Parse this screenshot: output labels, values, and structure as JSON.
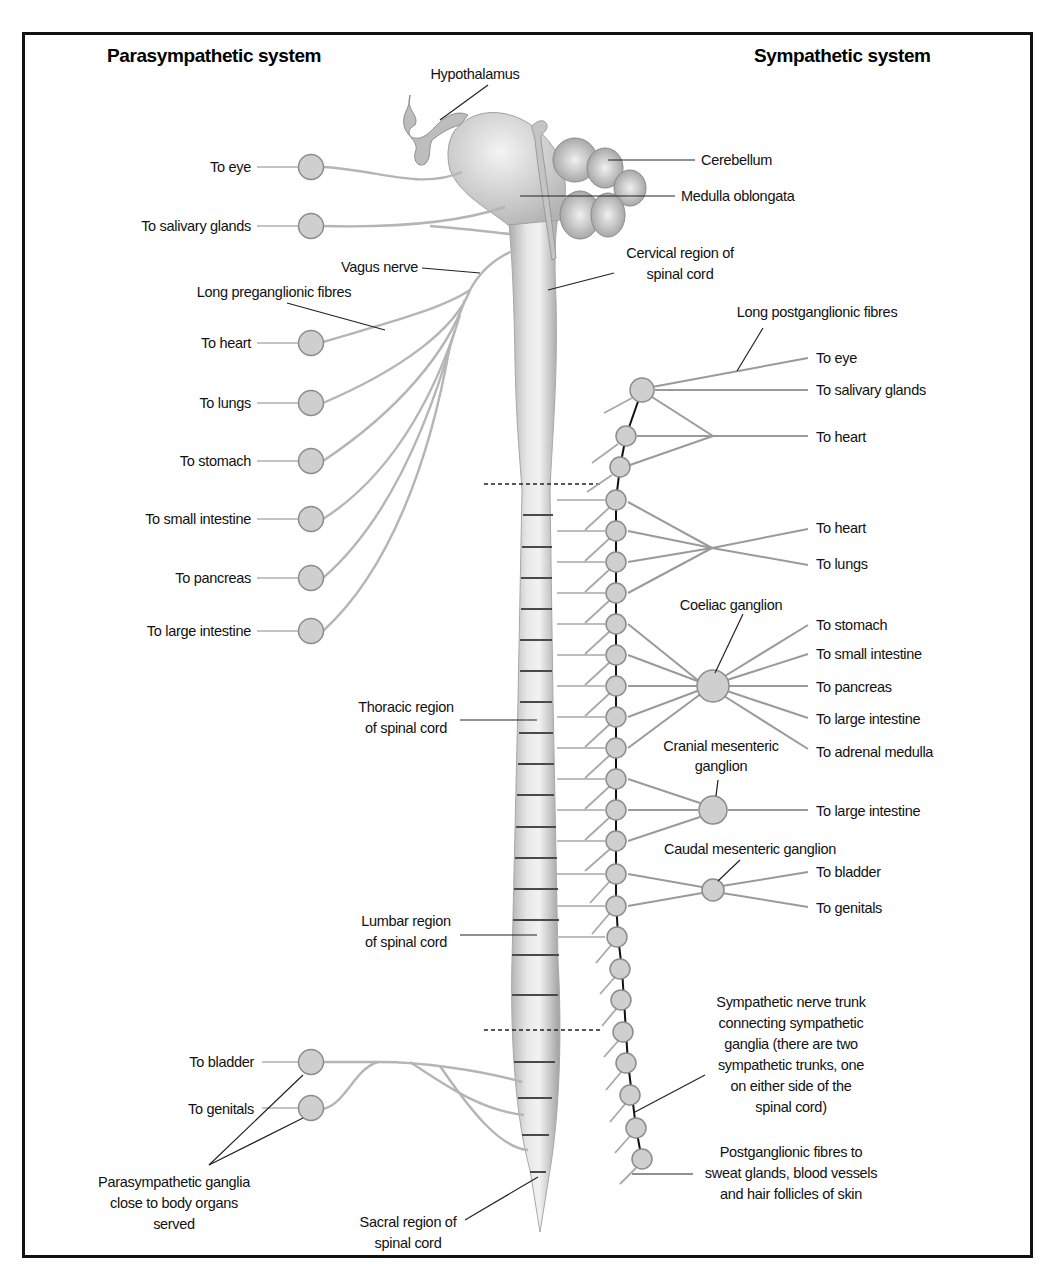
{
  "titles": {
    "parasympathetic": "Parasympathetic system",
    "sympathetic": "Sympathetic system"
  },
  "brain": {
    "hypothalamus": "Hypothalamus",
    "cerebellum": "Cerebellum",
    "medulla": "Medulla oblongata",
    "cervical_1": "Cervical region of",
    "cervical_2": "spinal cord",
    "thoracic_1": "Thoracic region",
    "thoracic_2": "of spinal cord",
    "lumbar_1": "Lumbar region",
    "lumbar_2": "of spinal cord",
    "sacral_1": "Sacral region of",
    "sacral_2": "spinal cord"
  },
  "parasympathetic": {
    "vagus": "Vagus nerve",
    "long_pre": "Long preganglionic fibres",
    "targets": [
      "To eye",
      "To salivary glands",
      "To heart",
      "To lungs",
      "To stomach",
      "To small intestine",
      "To pancreas",
      "To large intestine",
      "To bladder",
      "To genitals"
    ],
    "ganglia_note": [
      "Parasympathetic ganglia",
      "close to body organs",
      "served"
    ]
  },
  "sympathetic": {
    "long_post": "Long postganglionic fibres",
    "targets": [
      "To eye",
      "To salivary glands",
      "To heart",
      "To heart",
      "To lungs",
      "To stomach",
      "To small intestine",
      "To pancreas",
      "To large intestine",
      "To adrenal medulla",
      "To large intestine",
      "To bladder",
      "To genitals"
    ],
    "coeliac": "Coeliac ganglion",
    "cranial_mes_1": "Cranial mesenteric",
    "cranial_mes_2": "ganglion",
    "caudal_mes": "Caudal mesenteric ganglion",
    "trunk_note": [
      "Sympathetic nerve trunk",
      "connecting sympathetic",
      "ganglia (there are two",
      "sympathetic trunks, one",
      "on either side of the",
      "spinal cord)"
    ],
    "post_note": [
      "Postganglionic fibres to",
      "sweat glands, blood vessels",
      "and hair follicles of skin"
    ]
  },
  "colors": {
    "border": "#111111",
    "ganglion_fill": "#cfcfcf",
    "fibre": "#b5b5b5",
    "cord": "#d9d9d9"
  }
}
